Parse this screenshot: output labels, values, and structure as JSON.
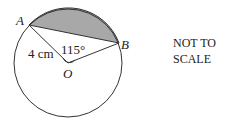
{
  "diagram": {
    "points": {
      "A": "A",
      "B": "B",
      "O": "O"
    },
    "radius_label": "4 cm",
    "angle_label": "115°",
    "note": {
      "line1": "NOT TO",
      "line2": "SCALE"
    },
    "colors": {
      "shaded_segment": "#a8a8a8",
      "stroke": "#333333"
    }
  }
}
